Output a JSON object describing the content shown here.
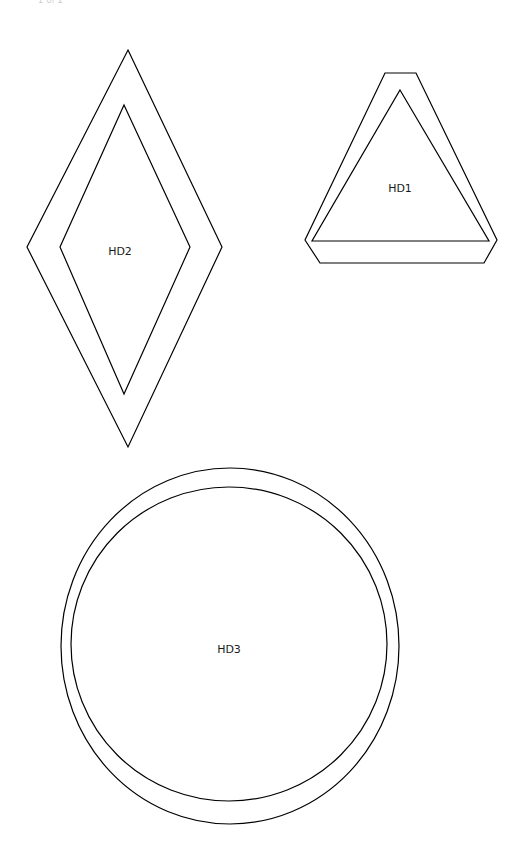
{
  "page": {
    "background_color": "#ffffff",
    "width": 529,
    "height": 861,
    "header_clipped_text": "1 of 2"
  },
  "style": {
    "stroke_color": "#000000",
    "stroke_width": 1.2,
    "label_color": "#1a1a1a",
    "label_font_size": 11
  },
  "shapes": [
    {
      "id": "HD1",
      "label": "HD1",
      "kind": "triangle-double-outline",
      "label_x": 400,
      "label_y": 189,
      "inner_points": "400,90 489,241 312,241",
      "outer_points": "385,73 416,73 497,240 484,263 320,263 305,240"
    },
    {
      "id": "HD2",
      "label": "HD2",
      "kind": "diamond-double-outline",
      "label_x": 120,
      "label_y": 252,
      "inner_points": "124,105 190,247 124,394 60,247",
      "outer_points": "128,50 222,247 128,447 27,247"
    },
    {
      "id": "HD3",
      "label": "HD3",
      "kind": "circle-double-outline",
      "label_x": 229,
      "label_y": 650,
      "outer_cx": 230,
      "outer_cy": 646,
      "outer_rx": 169,
      "outer_ry": 178,
      "inner_cx": 229,
      "inner_cy": 644,
      "inner_rx": 158,
      "inner_ry": 157
    }
  ]
}
